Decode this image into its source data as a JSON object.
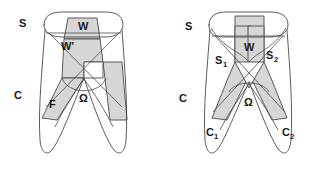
{
  "figure": {
    "background_color": "#ffffff",
    "outline_color": "#4a4a4a",
    "shade_color": "#d6d6d6",
    "panels": [
      {
        "id": "left-panel",
        "name": "panel-left",
        "labels": {
          "s": "S",
          "w": "W",
          "w_prime": "W'",
          "c": "C",
          "f": "F",
          "omega": "Ω"
        }
      },
      {
        "id": "right-panel",
        "name": "panel-right",
        "labels": {
          "s": "S",
          "w": "W",
          "s1": "S",
          "s1_sub": "1",
          "s2": "S",
          "s2_sub": "2",
          "c": "C",
          "c1": "C",
          "c1_sub": "1",
          "c2": "C",
          "c2_sub": "2",
          "omega": "Ω"
        }
      }
    ]
  }
}
